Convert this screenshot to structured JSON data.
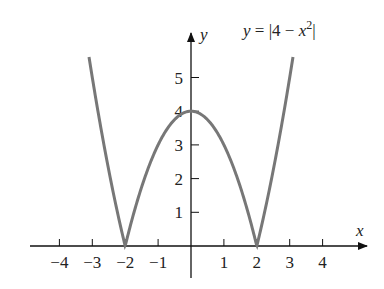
{
  "chart_data": {
    "type": "line",
    "title_parts": {
      "lhs": "y",
      "eq": " = |4 − ",
      "var": "x",
      "exp": "2",
      "close": "|"
    },
    "xlabel": "x",
    "ylabel": "y",
    "xlim": [
      -5.0,
      5.0
    ],
    "ylim": [
      -0.6,
      6.3
    ],
    "x_ticks": [
      -4,
      -3,
      -2,
      -1,
      1,
      2,
      3,
      4
    ],
    "x_tick_labels": [
      "−4",
      "−3",
      "−2",
      "−1",
      "1",
      "2",
      "3",
      "4"
    ],
    "y_ticks": [
      1,
      2,
      3,
      4,
      5
    ],
    "y_tick_labels": [
      "1",
      "2",
      "3",
      "4",
      "5"
    ],
    "grid": false,
    "legend": null,
    "series": [
      {
        "name": "y = |4 − x²|",
        "color": "#777777",
        "x": [
          -3.1,
          -3.0,
          -2.5,
          -2.0,
          -1.5,
          -1.0,
          -0.5,
          0.0,
          0.5,
          1.0,
          1.5,
          2.0,
          2.5,
          3.0,
          3.1
        ],
        "y": [
          5.61,
          5.0,
          2.25,
          0.0,
          1.75,
          3.0,
          3.75,
          4.0,
          3.75,
          3.0,
          1.75,
          0.0,
          2.25,
          5.0,
          5.61
        ]
      }
    ]
  }
}
